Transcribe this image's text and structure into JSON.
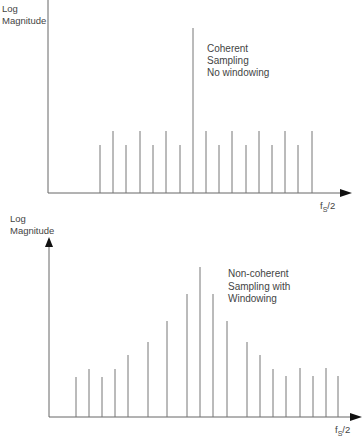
{
  "chart_data": [
    {
      "type": "bar",
      "subtype": "spectrum-stem",
      "title": "",
      "annotation": [
        "Coherent",
        "Sampling",
        "No windowing"
      ],
      "ylabel": [
        "Log",
        "Magnitude"
      ],
      "xlabel": "fS/2",
      "grid": false,
      "legend": null,
      "geometry": {
        "axis_x0": 48,
        "axis_y0": 193,
        "axis_top": 0,
        "axis_right": 352
      },
      "x": [
        100,
        113,
        126,
        140,
        153,
        166,
        180,
        193,
        206,
        219,
        232,
        246,
        259,
        272,
        285,
        298,
        312
      ],
      "values": [
        145,
        131,
        145,
        131,
        145,
        131,
        145,
        28,
        131,
        145,
        131,
        145,
        131,
        145,
        131,
        145,
        131
      ]
    },
    {
      "type": "bar",
      "subtype": "spectrum-stem",
      "title": "",
      "annotation": [
        "Non-coherent",
        "Sampling with",
        "Windowing"
      ],
      "ylabel": [
        "Log",
        "Magnitude"
      ],
      "xlabel": "fS/2",
      "grid": false,
      "legend": null,
      "geometry": {
        "axis_x0": 49,
        "axis_y0": 417,
        "axis_top": 238,
        "axis_right": 362
      },
      "x": [
        76,
        89,
        102,
        115,
        128,
        148,
        167,
        187,
        200,
        213,
        227,
        247,
        260,
        273,
        286,
        300,
        313,
        326,
        338
      ],
      "values": [
        377,
        369,
        377,
        369,
        355,
        342,
        321,
        294,
        267,
        294,
        321,
        342,
        355,
        369,
        376,
        368,
        376,
        368,
        376
      ]
    }
  ],
  "top": {
    "ylabel_line1": "Log",
    "ylabel_line2": "Magnitude",
    "note_line1": "Coherent",
    "note_line2": "Sampling",
    "note_line3": "No windowing",
    "x_end_label_f": "f",
    "x_end_label_sub": "S",
    "x_end_label_rest": "/2"
  },
  "bottom": {
    "ylabel_line1": "Log",
    "ylabel_line2": "Magnitude",
    "note_line1": "Non-coherent",
    "note_line2": "Sampling with",
    "note_line3": "Windowing",
    "x_end_label_f": "f",
    "x_end_label_sub": "S",
    "x_end_label_rest": "/2"
  },
  "colors": {
    "stroke": "#777777",
    "axis": "#666666",
    "arrow": "#111111"
  }
}
